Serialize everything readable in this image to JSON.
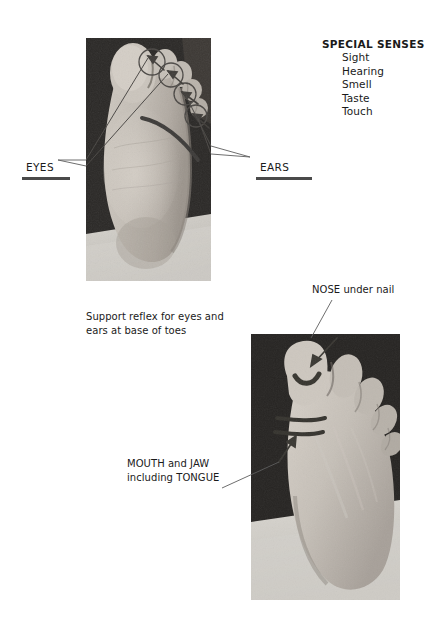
{
  "document": {
    "title": "Reflexology foot chart - special senses"
  },
  "special_senses": {
    "heading": "SPECIAL SENSES",
    "items": [
      "Sight",
      "Hearing",
      "Smell",
      "Taste",
      "Touch"
    ]
  },
  "labels": {
    "eyes": "EYES",
    "ears": "EARS",
    "nose": "NOSE under nail",
    "mouth": "MOUTH and JAW\nincluding TONGUE"
  },
  "captions": {
    "support_reflex": "Support reflex for eyes and\nears at base of toes"
  },
  "photos": {
    "sole": {
      "alt": "Sole of the foot showing four circled reflex points at the base of the toes",
      "marker_count": 4
    },
    "top": {
      "alt": "Top of the foot showing the big toe with nail marking and two bands at the toe base",
      "marker_count": 2
    }
  },
  "colors": {
    "background": "#ffffff",
    "text": "#1a1a1a",
    "rule": "#4a4a4a",
    "leader_line": "#5d5d5d",
    "marker": "#4f4f4f",
    "photo_dark": "#232323",
    "photo_skin": "#b9b3ac",
    "photo_skin_light": "#d2ccc4",
    "photo_sheet": "#cfcdc8"
  }
}
